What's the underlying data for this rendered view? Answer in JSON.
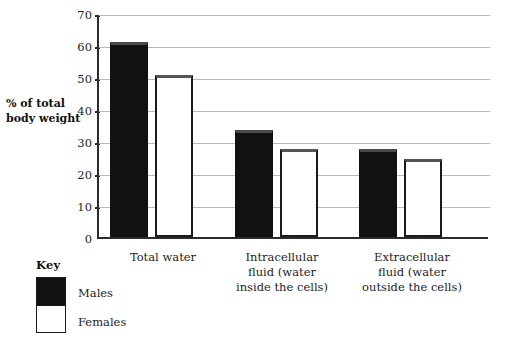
{
  "chart_data": {
    "type": "bar",
    "title": "",
    "subtitle": "",
    "xlabel": "",
    "ylabel": "% of total body weight",
    "ylim": [
      0,
      70
    ],
    "ytick_step": 10,
    "yticks": [
      0,
      10,
      20,
      30,
      40,
      50,
      60,
      70
    ],
    "grid": true,
    "legend_position": "bottom-left",
    "legend_title": "Key",
    "categories": [
      "Total water",
      "Intracellular fluid (water inside the cells)",
      "Extracellular fluid (water outside the cells)"
    ],
    "series": [
      {
        "name": "Males",
        "color": "#111111",
        "values": [
          61,
          33.5,
          27.5
        ]
      },
      {
        "name": "Females",
        "color": "#ffffff",
        "values": [
          50.5,
          27.5,
          24.5
        ]
      }
    ]
  },
  "axis": {
    "y_title": "% of total body weight",
    "tick_labels": [
      "70",
      "60",
      "50",
      "40",
      "30",
      "20",
      "10",
      "0"
    ]
  },
  "categories": {
    "c0_line1": "Total water",
    "c0_line2": "",
    "c0_line3": "",
    "c1_line1": "Intracellular",
    "c1_line2": "fluid (water",
    "c1_line3": "inside the cells)",
    "c2_line1": "Extracellular",
    "c2_line2": "fluid (water",
    "c2_line3": "outside the cells)"
  },
  "legend": {
    "title": "Key",
    "males_label": "Males",
    "females_label": "Females"
  }
}
